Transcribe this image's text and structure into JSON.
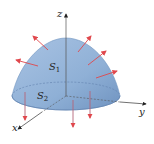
{
  "diagram": {
    "type": "paraboloid-surface-with-normals",
    "axes": {
      "x_label": "x",
      "y_label": "y",
      "z_label": "z"
    },
    "surfaces": [
      {
        "name": "S",
        "subscript": "1",
        "description": "paraboloid cap"
      },
      {
        "name": "S",
        "subscript": "2",
        "description": "flat disk base"
      }
    ],
    "normal_vectors": {
      "color": "#e0474c",
      "count_upper": 5,
      "count_lower": 3
    },
    "colors": {
      "surface_fill": "#8fb0d6",
      "surface_dark": "#6f93c0",
      "axis": "#333333"
    }
  }
}
